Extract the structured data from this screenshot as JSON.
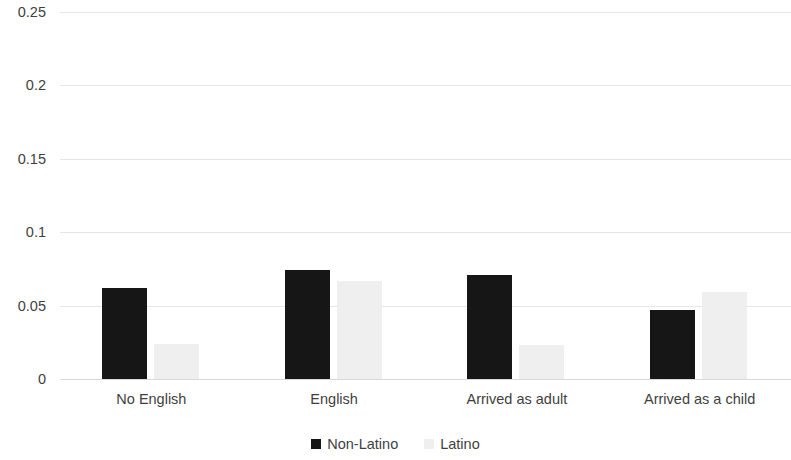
{
  "chart_data": {
    "type": "bar",
    "title": "",
    "subtitle": "",
    "xlabel": "",
    "ylabel": "",
    "categories": [
      "No English",
      "English",
      "Arrived as adult",
      "Arrived as a child"
    ],
    "series": [
      {
        "name": "Non-Latino",
        "color": "#161616",
        "values": [
          0.062,
          0.074,
          0.071,
          0.047
        ]
      },
      {
        "name": "Latino",
        "color": "#efefef",
        "values": [
          0.024,
          0.067,
          0.023,
          0.059
        ]
      }
    ],
    "ylim": [
      0,
      0.25
    ],
    "ytick_values": [
      0,
      0.05,
      0.1,
      0.15,
      0.2,
      0.25
    ],
    "ytick_labels": [
      "0",
      "0.05",
      "0.1",
      "0.15",
      "0.2",
      "0.25"
    ],
    "grid": true,
    "grid_axis": "y",
    "legend": true,
    "legend_position": "bottom",
    "legend_entries": [
      "Non-Latino",
      "Latino"
    ],
    "annotations": []
  },
  "colors": {
    "background": "#ffffff",
    "text": "#3f3f3f",
    "gridline": "#e6e6e6",
    "series_non_latino": "#161616",
    "series_latino": "#efefef"
  }
}
